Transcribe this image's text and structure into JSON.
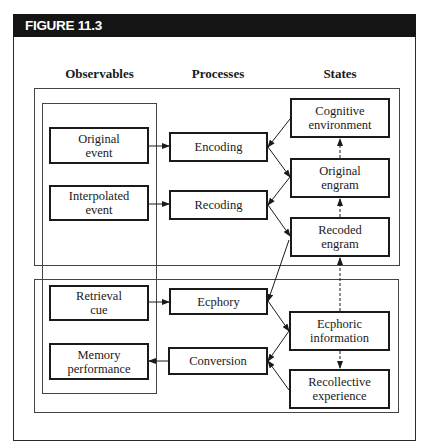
{
  "figure": {
    "label": "FIGURE 11.3",
    "header_color": "#141414"
  },
  "columns": {
    "observables": "Observables",
    "processes": "Processes",
    "states": "States"
  },
  "regions": [
    {
      "name": "top-region",
      "label": ""
    },
    {
      "name": "bottom-region",
      "label": ""
    },
    {
      "name": "observables-region",
      "label": ""
    }
  ],
  "nodes": {
    "original_event": "Original\nevent",
    "interpolated_event": "Interpolated\nevent",
    "retrieval_cue": "Retrieval\ncue",
    "memory_performance": "Memory\nperformance",
    "encoding": "Encoding",
    "recoding": "Recoding",
    "ecphory": "Ecphory",
    "conversion": "Conversion",
    "cognitive_environment": "Cognitive\nenvironment",
    "original_engram": "Original\nengram",
    "recoded_engram": "Recoded\nengram",
    "ecphoric_information": "Ecphoric\ninformation",
    "recollective_experience": "Recollective\nexperience"
  },
  "edges": [
    {
      "from": "Original event",
      "to": "Encoding",
      "style": "solid"
    },
    {
      "from": "Interpolated event",
      "to": "Recoding",
      "style": "solid"
    },
    {
      "from": "Retrieval cue",
      "to": "Ecphory",
      "style": "solid"
    },
    {
      "from": "Conversion",
      "to": "Memory performance",
      "style": "solid"
    },
    {
      "from": "Cognitive environment",
      "to": "Encoding",
      "style": "solid"
    },
    {
      "from": "Encoding",
      "to": "Original engram",
      "style": "solid"
    },
    {
      "from": "Original engram",
      "to": "Recoding",
      "style": "solid"
    },
    {
      "from": "Recoding",
      "to": "Recoded engram",
      "style": "solid"
    },
    {
      "from": "Recoded engram",
      "to": "Ecphory",
      "style": "solid"
    },
    {
      "from": "Ecphory",
      "to": "Ecphoric information",
      "style": "solid"
    },
    {
      "from": "Ecphoric information",
      "to": "Conversion",
      "style": "solid"
    },
    {
      "from": "Recollective experience",
      "to": "Conversion",
      "style": "solid"
    },
    {
      "from": "Original engram",
      "to": "Cognitive environment",
      "style": "dashed"
    },
    {
      "from": "Recoded engram",
      "to": "Original engram",
      "style": "dashed"
    },
    {
      "from": "Ecphoric information",
      "to": "Recoded engram",
      "style": "dashed"
    },
    {
      "from": "Ecphoric information",
      "to": "Recollective experience",
      "style": "dashed"
    }
  ]
}
